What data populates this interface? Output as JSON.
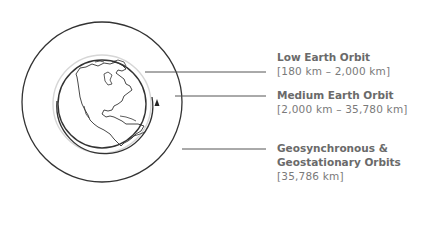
{
  "diagram": {
    "orbits": [
      {
        "id": "leo",
        "title": "Low Earth Orbit",
        "range": "[180 km – 2,000 km]"
      },
      {
        "id": "meo",
        "title": "Medium Earth Orbit",
        "range": "[2,000 km – 35,780 km]"
      },
      {
        "id": "geo",
        "title_line1": "Geosynchronous &",
        "title_line2": "Geostationary Orbits",
        "range": "[35,786 km]"
      }
    ],
    "colors": {
      "line": "#333333",
      "leo_ring": "#d6d6d6",
      "text": "#6a6a6a"
    }
  }
}
